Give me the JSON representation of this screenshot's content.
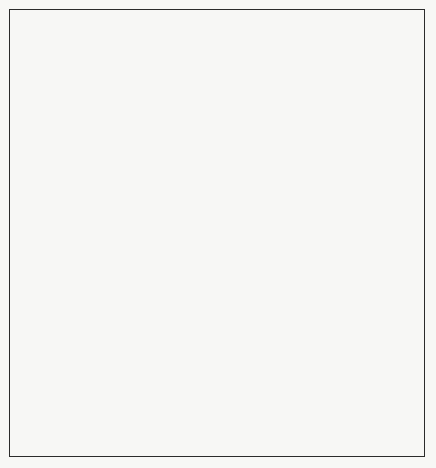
{
  "figure": {
    "background_color": "#f7f7f5",
    "line_color": "#1f1f1f",
    "frame_color": "#2b2b2b"
  },
  "levels": [
    {
      "id": "level-4",
      "label": "Level 4",
      "label_x": 22,
      "label_y": 90,
      "leader_from_x": 57,
      "leader_to_x": 104,
      "leader_y": 87,
      "ellipse_cx": 213,
      "ellipse_cy": 73,
      "ellipse_rx": 113,
      "ellipse_ry": 47,
      "person_count": 12
    },
    {
      "id": "level-3",
      "label": "Level 3",
      "label_x": 22,
      "label_y": 210,
      "leader_from_x": 57,
      "leader_to_x": 139,
      "leader_y": 207,
      "ellipse_cx": 213,
      "ellipse_cy": 203,
      "ellipse_rx": 74,
      "ellipse_ry": 31,
      "person_count": 7
    },
    {
      "id": "level-2",
      "label": "Level 2",
      "label_x": 22,
      "label_y": 315,
      "leader_from_x": 57,
      "leader_to_x": 178,
      "leader_y": 312,
      "ellipse_cx": 213,
      "ellipse_cy": 310,
      "ellipse_rx": 36,
      "ellipse_ry": 16,
      "person_count": 2
    },
    {
      "id": "level-1",
      "label": "Level 1",
      "label_x": 22,
      "label_y": 382,
      "leader_from_x": 57,
      "leader_to_x": 194,
      "leader_y": 379,
      "ellipse_cx": 213,
      "ellipse_cy": 378,
      "ellipse_rx": 19,
      "ellipse_ry": 9,
      "person_count": 0
    }
  ],
  "apex": {
    "x": 213,
    "y": 440
  },
  "zone_letters": [
    {
      "letter": "C",
      "name": "channeling",
      "x": 213,
      "y": 48
    },
    {
      "letter": "R",
      "name": "receiving",
      "x": 193,
      "y": 70
    },
    {
      "letter": "S",
      "name": "sending",
      "x": 232,
      "y": 70
    },
    {
      "letter": "E",
      "name": "evaluating",
      "x": 213,
      "y": 110
    }
  ],
  "persons_level4": [
    {
      "x": 127,
      "y": 79
    },
    {
      "x": 155,
      "y": 62
    },
    {
      "x": 156,
      "y": 99
    },
    {
      "x": 131,
      "y": 110
    },
    {
      "x": 199,
      "y": 31
    },
    {
      "x": 227,
      "y": 31
    },
    {
      "x": 192,
      "y": 81
    },
    {
      "x": 232,
      "y": 81
    },
    {
      "x": 200,
      "y": 118
    },
    {
      "x": 228,
      "y": 118
    },
    {
      "x": 212,
      "y": 133
    },
    {
      "x": 268,
      "y": 63
    },
    {
      "x": 294,
      "y": 80
    },
    {
      "x": 268,
      "y": 103
    }
  ],
  "persons_level3": [
    {
      "x": 155,
      "y": 206
    },
    {
      "x": 183,
      "y": 197
    },
    {
      "x": 200,
      "y": 199
    },
    {
      "x": 226,
      "y": 199
    },
    {
      "x": 243,
      "y": 197
    },
    {
      "x": 270,
      "y": 206
    },
    {
      "x": 212,
      "y": 228
    }
  ],
  "persons_level2": [
    {
      "x": 181,
      "y": 312
    },
    {
      "x": 245,
      "y": 312
    }
  ],
  "persons_level1": [],
  "legend": {
    "x": 305,
    "y": 355,
    "line_height": 18,
    "entries": [
      {
        "key": "E:",
        "name": "evaluating",
        "value": "Evaluating",
        "glyph": false
      },
      {
        "key": "S:",
        "name": "sending",
        "value": "Sending",
        "glyph": false
      },
      {
        "key": "C:",
        "name": "channeling",
        "value": "Channeling",
        "glyph": false
      },
      {
        "key": "R:",
        "name": "receiving",
        "value": "Receiving",
        "glyph": false
      },
      {
        "key": "",
        "name": "one-person",
        "value": "One Person",
        "glyph": true
      }
    ]
  }
}
